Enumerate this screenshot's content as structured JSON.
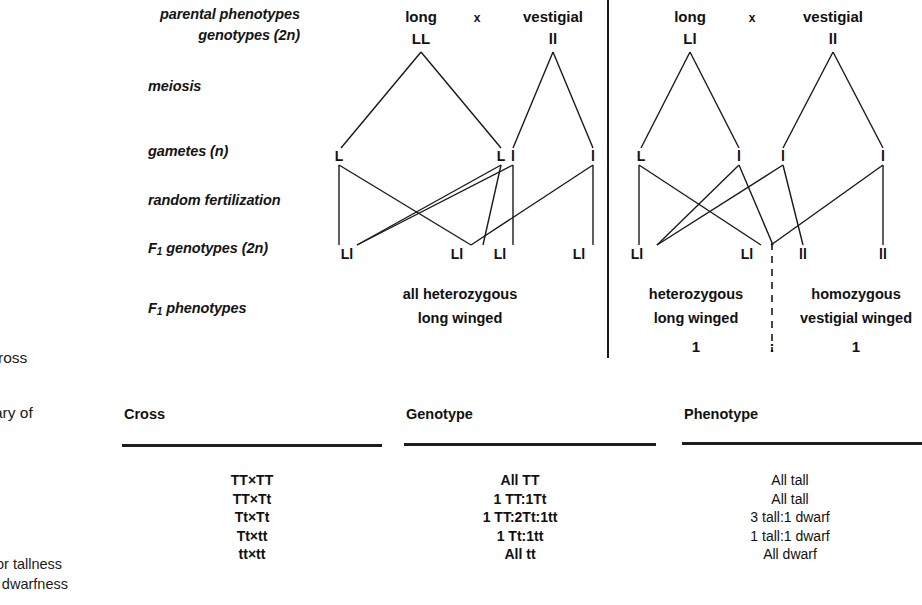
{
  "stage_labels": [
    {
      "id": "parental-phenotypes",
      "text": "parental phenotypes"
    },
    {
      "id": "genotypes-2n",
      "text": "genotypes (2n)"
    },
    {
      "id": "meiosis",
      "text": "meiosis"
    },
    {
      "id": "gametes-n",
      "text": "gametes (n)"
    },
    {
      "id": "random-fertilization",
      "text": "random fertilization"
    },
    {
      "id": "f1-genotypes",
      "text": "F1 genotypes (2n)"
    },
    {
      "id": "f1-phenotypes",
      "text": "F1 phenotypes"
    }
  ],
  "left_panel": {
    "parent1_phenotype": "long",
    "parent1_genotype": "LL",
    "cross_symbol": "x",
    "parent2_phenotype": "vestigial",
    "parent2_genotype": "ll",
    "gametes": [
      "L",
      "L",
      "l",
      "l"
    ],
    "f1_genotypes": [
      "Ll",
      "Ll",
      "Ll",
      "Ll"
    ],
    "f1_phenotype_line1": "all heterozygous",
    "f1_phenotype_line2": "long winged"
  },
  "right_panel": {
    "parent1_phenotype": "long",
    "parent1_genotype": "Ll",
    "cross_symbol": "x",
    "parent2_phenotype": "vestigial",
    "parent2_genotype": "ll",
    "gametes": [
      "L",
      "l",
      "l",
      "l"
    ],
    "f1_genotypes": [
      "Ll",
      "Ll",
      "ll",
      "ll"
    ],
    "f1_phenotype_left_line1": "heterozygous",
    "f1_phenotype_left_line2": "long winged",
    "f1_phenotype_right_line1": "homozygous",
    "f1_phenotype_right_line2": "vestigial winged",
    "ratio_left": "1",
    "ratio_colon": ":",
    "ratio_right": "1"
  },
  "table": {
    "headers": [
      "Cross",
      "Genotype",
      "Phenotype"
    ],
    "cross_values": [
      "TT×TT",
      "TT×Tt",
      "Tt×Tt",
      "Tt×tt",
      "tt×tt"
    ],
    "genotype_values": [
      "All TT",
      "1 TT:1Tt",
      "1 TT:2Tt:1tt",
      "1 Tt:1tt",
      "All tt"
    ],
    "phenotype_values": [
      "All tall",
      "All tall",
      "3 tall:1 dwarf",
      "1 tall:1 dwarf",
      "All dwarf"
    ]
  },
  "margin_text": {
    "caption_cross": "ross",
    "caption_summary": "ary of",
    "legend_tall": "or tallness",
    "legend_dwarf": "r dwarfness"
  },
  "colors": {
    "ink": "#1a1a1a",
    "page": "#ffffff"
  }
}
